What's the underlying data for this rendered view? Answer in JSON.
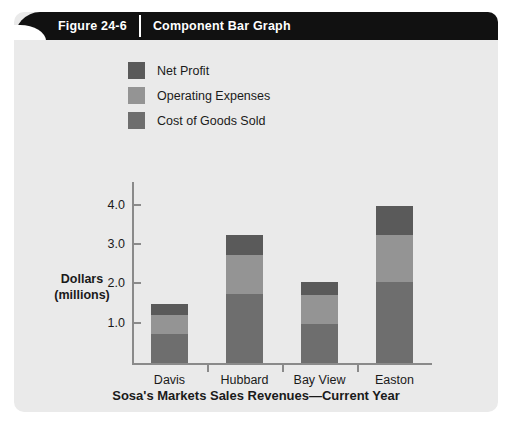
{
  "figure": {
    "number": "Figure 24-6",
    "title": "Component Bar Graph"
  },
  "colors": {
    "panel_background": "#eaeaea",
    "banner": "#111111",
    "axis": "#8a8a8a",
    "net_profit": "#5a5a5a",
    "operating_expenses": "#949494",
    "cost_of_goods_sold": "#6e6e6e"
  },
  "chart_data": {
    "type": "bar",
    "stacked": true,
    "title": "Sosa's Markets Sales Revenues—Current Year",
    "xlabel": "Sosa's Markets Sales Revenues—Current Year",
    "ylabel": "Dollars (millions)",
    "ylabel_line1": "Dollars",
    "ylabel_line2": "(millions)",
    "categories": [
      "Davis",
      "Hubbard",
      "Bay View",
      "Easton"
    ],
    "yticks": [
      "1.0",
      "2.0",
      "3.0",
      "4.0"
    ],
    "ytick_values": [
      1.0,
      2.0,
      3.0,
      4.0
    ],
    "ylim": [
      0,
      4.4
    ],
    "grid": false,
    "legend_position": "top-left",
    "series": [
      {
        "name": "Cost of Goods Sold",
        "color": "#6e6e6e",
        "values": [
          0.75,
          1.75,
          1.0,
          2.05
        ]
      },
      {
        "name": "Operating Expenses",
        "color": "#949494",
        "values": [
          0.47,
          1.0,
          0.72,
          1.2
        ]
      },
      {
        "name": "Net Profit",
        "color": "#5a5a5a",
        "values": [
          0.28,
          0.5,
          0.33,
          0.75
        ]
      }
    ],
    "totals": [
      1.5,
      3.25,
      2.05,
      4.0
    ],
    "legend": [
      "Net Profit",
      "Operating Expenses",
      "Cost of Goods Sold"
    ]
  }
}
